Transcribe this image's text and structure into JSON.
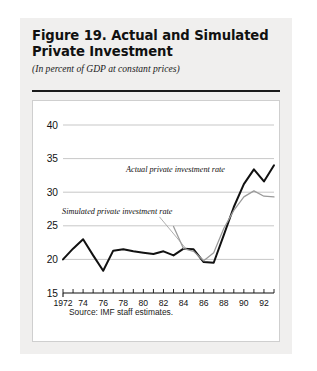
{
  "figure": {
    "title_line1": "Figure 19.  Actual and Simulated",
    "title_line2": "Private Investment",
    "subtitle": "(In percent of GDP at constant prices)",
    "source": "Source:  IMF staff estimates."
  },
  "chart_data": {
    "type": "line",
    "title": "Figure 19. Actual and Simulated Private Investment",
    "subtitle": "(In percent of GDP at constant prices)",
    "xlabel": "",
    "ylabel": "",
    "xlim": [
      1972,
      1993
    ],
    "ylim": [
      15,
      40
    ],
    "yticks": [
      15,
      20,
      25,
      30,
      35,
      40
    ],
    "ytick_labels": [
      "15",
      "20",
      "25",
      "30",
      "35",
      "40"
    ],
    "xticks": [
      1972,
      1973,
      1974,
      1975,
      1976,
      1977,
      1978,
      1979,
      1980,
      1981,
      1982,
      1983,
      1984,
      1985,
      1986,
      1987,
      1988,
      1989,
      1990,
      1991,
      1992,
      1993
    ],
    "xtick_labels": [
      "1972",
      "74",
      "76",
      "78",
      "80",
      "82",
      "84",
      "86",
      "88",
      "90",
      "92"
    ],
    "xtick_label_years": [
      1972,
      1974,
      1976,
      1978,
      1980,
      1982,
      1984,
      1986,
      1988,
      1990,
      1992
    ],
    "grid": "horizontal",
    "legend_position": "inline-annotations",
    "series": [
      {
        "name": "Actual private investment rate",
        "color": "#111111",
        "x": [
          1972,
          1973,
          1974,
          1975,
          1976,
          1977,
          1978,
          1979,
          1980,
          1981,
          1982,
          1983,
          1984,
          1985,
          1986,
          1987,
          1988,
          1989,
          1990,
          1991,
          1992,
          1993
        ],
        "values": [
          20.0,
          21.6,
          23.0,
          20.6,
          18.3,
          21.3,
          21.5,
          21.2,
          21.0,
          20.8,
          21.2,
          20.6,
          21.6,
          21.5,
          19.6,
          19.5,
          23.6,
          27.8,
          31.2,
          33.4,
          31.6,
          34.0
        ]
      },
      {
        "name": "Simulated private investment rate",
        "color": "#9a9a9a",
        "x": [
          1983,
          1984,
          1985,
          1986,
          1987,
          1988,
          1989,
          1990,
          1991,
          1992,
          1993
        ],
        "values": [
          24.9,
          21.6,
          21.2,
          19.8,
          21.0,
          24.6,
          27.3,
          29.3,
          30.2,
          29.4,
          29.3
        ]
      }
    ],
    "annotations": [
      {
        "text": "Actual private investment rate",
        "year": 1983.2,
        "value": 33.0
      },
      {
        "text": "Simulated private investment rate",
        "year": 1977.4,
        "value": 26.7
      }
    ]
  }
}
